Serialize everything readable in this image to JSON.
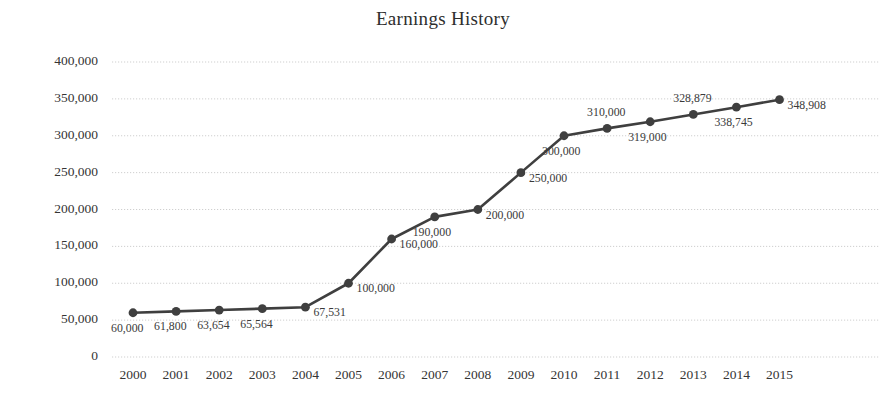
{
  "chart_data": {
    "type": "line",
    "title": "Earnings History",
    "xlabel": "",
    "ylabel": "",
    "categories": [
      "2000",
      "2001",
      "2002",
      "2003",
      "2004",
      "2005",
      "2006",
      "2007",
      "2008",
      "2009",
      "2010",
      "2011",
      "2012",
      "2013",
      "2014",
      "2015"
    ],
    "values": [
      60000,
      61800,
      63654,
      65564,
      67531,
      100000,
      160000,
      190000,
      200000,
      250000,
      300000,
      310000,
      319000,
      328879,
      338745,
      348908
    ],
    "point_labels": [
      "60,000",
      "61,800",
      "63,654",
      "65,564",
      "67,531",
      "100,000",
      "160,000",
      "190,000",
      "200,000",
      "250,000",
      "300,000",
      "310,000",
      "319,000",
      "328,879",
      "338,745",
      "348,908"
    ],
    "ylim": [
      0,
      400000
    ],
    "y_ticks": [
      0,
      50000,
      100000,
      150000,
      200000,
      250000,
      300000,
      350000,
      400000
    ],
    "y_tick_labels": [
      "0",
      "50,000",
      "100,000",
      "150,000",
      "200,000",
      "250,000",
      "300,000",
      "350,000",
      "400,000"
    ],
    "grid": true,
    "grid_axis": "y",
    "legend": "none",
    "series_color": "#3f3f3f",
    "marker": "circle",
    "label_positions": [
      "below",
      "below",
      "below",
      "below",
      "right",
      "right",
      "right",
      "below",
      "right",
      "right",
      "below",
      "above",
      "below",
      "above",
      "below",
      "right"
    ]
  }
}
